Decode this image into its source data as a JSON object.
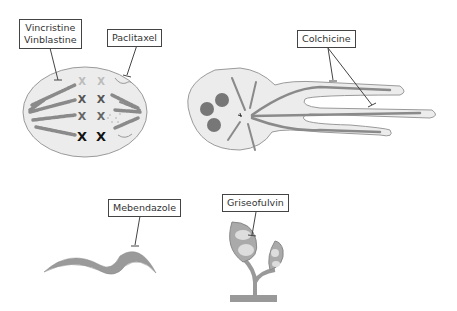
{
  "diagram": {
    "title": "",
    "labels": {
      "vinca": {
        "line1": "Vincristine",
        "line2": "Vinblastine"
      },
      "paclitaxel": "Paclitaxel",
      "colchicine": "Colchicine",
      "mebendazole": "Mebendazole",
      "griseofulvin": "Griseofulvin"
    },
    "figures": [
      {
        "id": "mitotic-spindle",
        "description": "Dividing cell with mitotic spindle and chromosomes"
      },
      {
        "id": "neutrophil",
        "description": "Cell with microtubule-filled projections"
      },
      {
        "id": "worm",
        "description": "Helminth"
      },
      {
        "id": "fungus",
        "description": "Fungal conidiophore"
      }
    ],
    "colors": {
      "cell_fill": "#ebebeb",
      "outline": "#999999",
      "microtubule": "#8a8a8a",
      "chromosome": "#222222",
      "label_border": "#444444",
      "worm": "#9a9a9a"
    }
  }
}
